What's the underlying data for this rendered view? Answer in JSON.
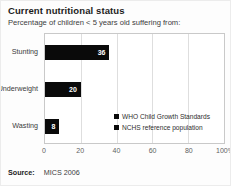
{
  "header": {
    "title": "Current nutritional status",
    "subtitle": "Percentage of children < 5 years old suffering from:"
  },
  "chart_data": {
    "type": "bar",
    "orientation": "horizontal",
    "title": "Current nutritional status",
    "subtitle": "Percentage of children < 5 years old suffering from:",
    "categories": [
      "Stunting",
      "Underweight",
      "Wasting"
    ],
    "values": [
      36,
      20,
      8
    ],
    "value_labels": [
      "36",
      "20",
      "8"
    ],
    "bar_color": "#0a0a0a",
    "value_label_color": "#ffffff",
    "xlim": [
      0,
      100
    ],
    "x_ticks": [
      0,
      20,
      40,
      60,
      80,
      100
    ],
    "x_tick_labels": [
      "0",
      "20",
      "40",
      "60",
      "80",
      "100%"
    ],
    "grid": "vertical",
    "legend": {
      "position": "inside-bottom-right",
      "entries": [
        {
          "label": "WHO Child Growth Standards",
          "marker_color": "#0a0a0a"
        },
        {
          "label": "NCHS reference population",
          "marker_color": "#0a0a0a"
        }
      ]
    }
  },
  "footer": {
    "source_label": "Source:",
    "source_value": "MICS 2006"
  }
}
